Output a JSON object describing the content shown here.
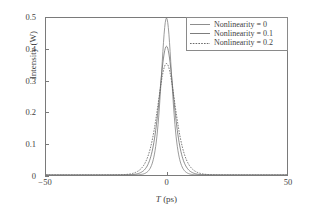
{
  "chart_data": {
    "type": "line",
    "title": "",
    "xlabel": "T (ps)",
    "ylabel": "Intensity (W)",
    "xlim": [
      -50,
      50
    ],
    "ylim": [
      0,
      0.5
    ],
    "grid": false,
    "legend_position": "upper right",
    "x_ticks": [
      {
        "value": -50,
        "label": "−50"
      },
      {
        "value": 0,
        "label": "0"
      },
      {
        "value": 50,
        "label": "50"
      }
    ],
    "y_ticks": [
      {
        "value": 0,
        "label": "0"
      },
      {
        "value": 0.1,
        "label": "0.1"
      },
      {
        "value": 0.2,
        "label": "0.2"
      },
      {
        "value": 0.3,
        "label": "0.3"
      },
      {
        "value": 0.4,
        "label": "0.4"
      },
      {
        "value": 0.5,
        "label": "0.5"
      }
    ],
    "series": [
      {
        "name": "Nonlinearity = 0",
        "peak_value": 0.5,
        "peak_x": 0,
        "half_width_ps": 3.0,
        "color": "#808080",
        "dash": "none",
        "x": [
          -50,
          -20,
          -16,
          -12,
          -10,
          -8,
          -7,
          -6,
          -5,
          -4.5,
          -4,
          -3.5,
          -3,
          -2.5,
          -2,
          -1.5,
          -1,
          -0.5,
          0,
          0.5,
          1,
          1.5,
          2,
          2.5,
          3,
          3.5,
          4,
          4.5,
          5,
          6,
          7,
          8,
          10,
          12,
          16,
          20,
          50
        ],
        "y": [
          0,
          0.0005,
          0.0012,
          0.0035,
          0.0065,
          0.0135,
          0.0205,
          0.0325,
          0.0525,
          0.0675,
          0.0875,
          0.1145,
          0.1495,
          0.1935,
          0.2455,
          0.3035,
          0.3615,
          0.4105,
          0.4425,
          0.4105,
          0.3615,
          0.3035,
          0.2455,
          0.1935,
          0.1495,
          0.1145,
          0.0875,
          0.0675,
          0.0525,
          0.0325,
          0.0205,
          0.0135,
          0.0065,
          0.0035,
          0.0012,
          0.0005,
          0
        ]
      },
      {
        "name": "Nonlinearity = 0.1",
        "peak_value": 0.41,
        "peak_x": 0,
        "half_width_ps": 4.0,
        "color": "#6e6e6e",
        "dash": "none",
        "x": [
          -50,
          -25,
          -20,
          -16,
          -13,
          -11,
          -9,
          -8,
          -7,
          -6,
          -5,
          -4,
          -3.5,
          -3,
          -2.5,
          -2,
          -1.5,
          -1,
          -0.5,
          0,
          0.5,
          1,
          1.5,
          2,
          2.5,
          3,
          3.5,
          4,
          5,
          6,
          7,
          8,
          9,
          11,
          13,
          16,
          20,
          25,
          50
        ],
        "y": [
          0,
          0.0004,
          0.0011,
          0.0028,
          0.0058,
          0.0098,
          0.0178,
          0.0248,
          0.0348,
          0.0498,
          0.0718,
          0.1048,
          0.1268,
          0.1538,
          0.1858,
          0.2228,
          0.2628,
          0.3018,
          0.3338,
          0.3468,
          0.3338,
          0.3018,
          0.2628,
          0.2228,
          0.1858,
          0.1538,
          0.1268,
          0.1048,
          0.0718,
          0.0498,
          0.0348,
          0.0248,
          0.0178,
          0.0098,
          0.0058,
          0.0028,
          0.0011,
          0.0004,
          0
        ]
      },
      {
        "name": "Nonlinearity = 0.2",
        "peak_value": 0.355,
        "peak_x": 0,
        "half_width_ps": 5.0,
        "color": "#5a5a5a",
        "dash": "dotted",
        "x": [
          -50,
          -30,
          -25,
          -20,
          -17,
          -15,
          -13,
          -11,
          -10,
          -9,
          -8,
          -7,
          -6,
          -5,
          -4,
          -3.5,
          -3,
          -2.5,
          -2,
          -1.5,
          -1,
          -0.5,
          0,
          0.5,
          1,
          1.5,
          2,
          2.5,
          3,
          3.5,
          4,
          5,
          6,
          7,
          8,
          9,
          10,
          11,
          13,
          15,
          17,
          20,
          25,
          30,
          50
        ],
        "y": [
          0,
          0.0004,
          0.0009,
          0.0022,
          0.0042,
          0.0062,
          0.0092,
          0.0142,
          0.0177,
          0.0222,
          0.0287,
          0.0377,
          0.0497,
          0.0667,
          0.0887,
          0.1017,
          0.1167,
          0.1337,
          0.1527,
          0.1727,
          0.1927,
          0.2097,
          0.2167,
          0.2097,
          0.1927,
          0.1727,
          0.1527,
          0.1337,
          0.1167,
          0.1017,
          0.0887,
          0.0667,
          0.0497,
          0.0377,
          0.0287,
          0.0222,
          0.0177,
          0.0142,
          0.0092,
          0.0062,
          0.0042,
          0.0022,
          0.0009,
          0.0004,
          0
        ]
      }
    ]
  },
  "legend": {
    "entries": [
      {
        "label": "Nonlinearity = 0"
      },
      {
        "label": "Nonlinearity = 0.1"
      },
      {
        "label": "Nonlinearity = 0.2"
      }
    ]
  },
  "axes": {
    "x_title_var": "T",
    "x_title_unit": "(ps)",
    "y_title": "Intensity (W)"
  },
  "colors": {
    "frame": "#7a7a7a",
    "background": "#ffffff",
    "text": "#3f3f3f"
  }
}
